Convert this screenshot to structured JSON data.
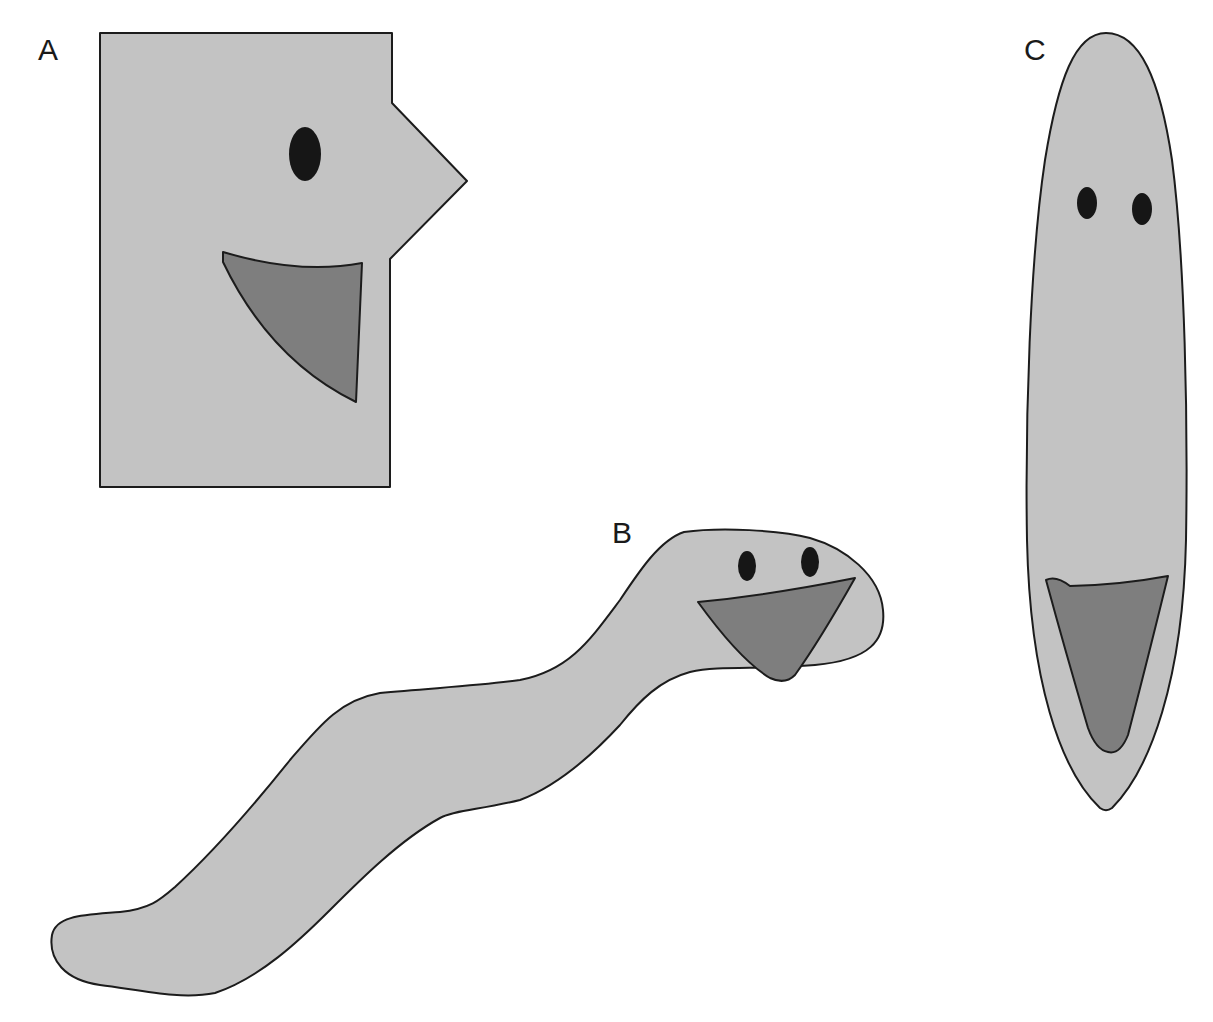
{
  "figure": {
    "colors": {
      "background": "#ffffff",
      "body": "#c3c3c3",
      "mouth": "#7e7e7e",
      "eye": "#161616",
      "outline": "#1c1c1c"
    },
    "shapes": [
      {
        "label": "A",
        "form": "rectangle-head-with-triangular-nose",
        "eyes": 1
      },
      {
        "label": "B",
        "form": "worm-like-wavy-body",
        "eyes": 2
      },
      {
        "label": "C",
        "form": "elongated-ellipse",
        "eyes": 2
      }
    ]
  }
}
